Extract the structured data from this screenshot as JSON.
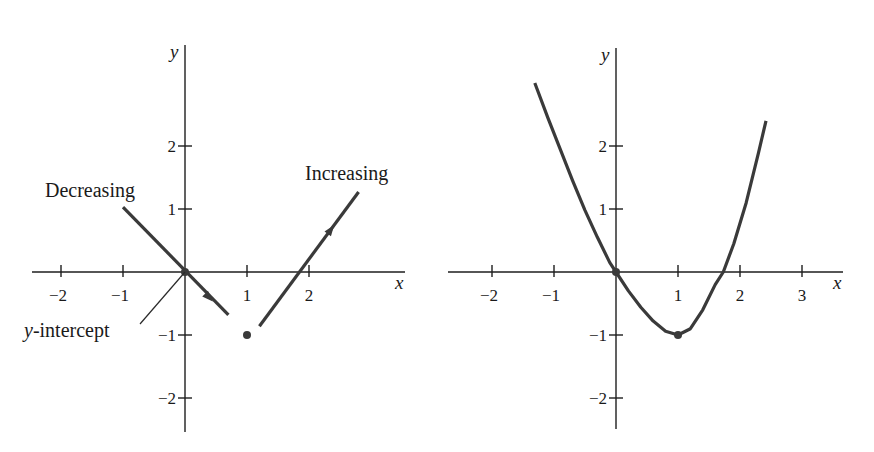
{
  "chart_data": [
    {
      "type": "line",
      "title": "",
      "xlabel": "x",
      "ylabel": "y",
      "xlim": [
        -2.5,
        3.5
      ],
      "ylim": [
        -2.5,
        3.6
      ],
      "grid": false,
      "x_ticks": [
        {
          "value": -2,
          "label": "−2"
        },
        {
          "value": -1,
          "label": "−1"
        },
        {
          "value": 1,
          "label": "1"
        },
        {
          "value": 2,
          "label": "2"
        }
      ],
      "y_ticks": [
        {
          "value": 2,
          "label": "2"
        },
        {
          "value": 1,
          "label": "1"
        },
        {
          "value": -1,
          "label": "−1"
        },
        {
          "value": -2,
          "label": "−2"
        }
      ],
      "series": [
        {
          "name": "decreasing-segment",
          "points": [
            [
              -1,
              1.03
            ],
            [
              0.7,
              -0.68
            ]
          ],
          "arrow_at": [
            0.38,
            -0.4
          ],
          "arrow_direction": "down-right"
        },
        {
          "name": "increasing-segment",
          "points": [
            [
              1.2,
              -0.86
            ],
            [
              2.8,
              1.27
            ]
          ],
          "arrow_at": [
            2.35,
            0.67
          ],
          "arrow_direction": "up-right"
        }
      ],
      "points": [
        {
          "name": "y-intercept-point",
          "x": 0,
          "y": 0
        },
        {
          "name": "isolated-point",
          "x": 1,
          "y": -1
        }
      ],
      "annotations": [
        {
          "text": "Decreasing",
          "target": "decreasing-segment"
        },
        {
          "text": "Increasing",
          "target": "increasing-segment"
        },
        {
          "text": "-intercept",
          "prefix_italic": "y",
          "target": "y-intercept-point"
        }
      ]
    },
    {
      "type": "line",
      "title": "",
      "xlabel": "x",
      "ylabel": "y",
      "xlim": [
        -2.7,
        3.7
      ],
      "ylim": [
        -2.5,
        3.6
      ],
      "grid": false,
      "x_ticks": [
        {
          "value": -2,
          "label": "−2"
        },
        {
          "value": -1,
          "label": "−1"
        },
        {
          "value": 1,
          "label": "1"
        },
        {
          "value": 2,
          "label": "2"
        },
        {
          "value": 3,
          "label": "3"
        }
      ],
      "y_ticks": [
        {
          "value": 2,
          "label": "2"
        },
        {
          "value": 1,
          "label": "1"
        },
        {
          "value": -1,
          "label": "−1"
        },
        {
          "value": -2,
          "label": "−2"
        }
      ],
      "series": [
        {
          "name": "curve",
          "points": [
            [
              -1.31,
              3.0
            ],
            [
              -1.1,
              2.45
            ],
            [
              -0.9,
              1.95
            ],
            [
              -0.7,
              1.45
            ],
            [
              -0.5,
              0.98
            ],
            [
              -0.3,
              0.55
            ],
            [
              -0.1,
              0.15
            ],
            [
              0,
              0
            ],
            [
              0.2,
              -0.3
            ],
            [
              0.4,
              -0.56
            ],
            [
              0.6,
              -0.78
            ],
            [
              0.8,
              -0.94
            ],
            [
              1.0,
              -1.0
            ],
            [
              1.2,
              -0.9
            ],
            [
              1.4,
              -0.6
            ],
            [
              1.6,
              -0.2
            ],
            [
              1.73,
              0.0
            ],
            [
              1.9,
              0.45
            ],
            [
              2.1,
              1.1
            ],
            [
              2.3,
              1.9
            ],
            [
              2.42,
              2.4
            ]
          ]
        }
      ],
      "points": [
        {
          "name": "origin-point",
          "x": 0,
          "y": 0
        },
        {
          "name": "minimum-point",
          "x": 1,
          "y": -1
        }
      ],
      "annotations": []
    }
  ]
}
